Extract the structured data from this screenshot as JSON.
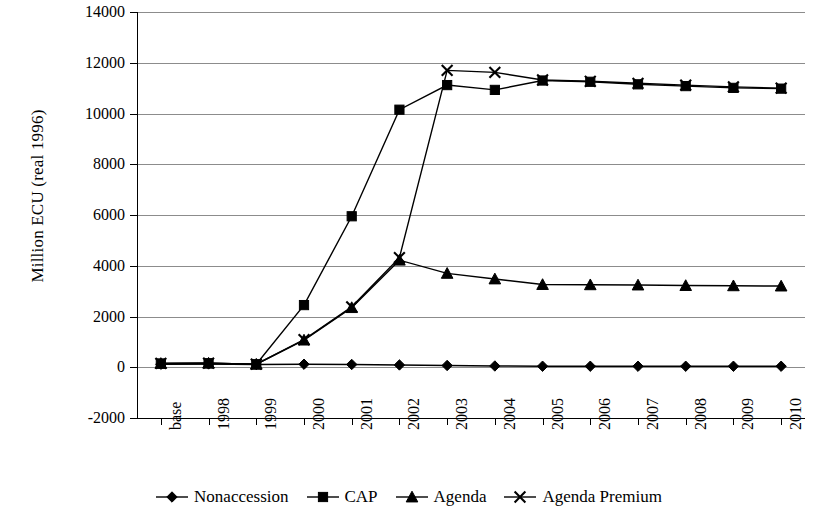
{
  "chart_data": {
    "type": "line",
    "title": "",
    "xlabel": "",
    "ylabel": "Million ECU (real 1996)",
    "categories": [
      "base",
      "1998",
      "1999",
      "2000",
      "2001",
      "2002",
      "2003",
      "2004",
      "2005",
      "2006",
      "2007",
      "2008",
      "2009",
      "2010"
    ],
    "ylim": [
      -2000,
      14000
    ],
    "ytick_step": 2000,
    "yticks": [
      "14000",
      "12000",
      "10000",
      "8000",
      "6000",
      "4000",
      "2000",
      "0",
      "-2000"
    ],
    "grid": true,
    "legend_position": "bottom",
    "series": [
      {
        "name": "Nonaccession",
        "marker": "diamond",
        "values": [
          120,
          130,
          110,
          120,
          110,
          90,
          70,
          50,
          40,
          40,
          40,
          40,
          40,
          40
        ]
      },
      {
        "name": "CAP",
        "marker": "square",
        "values": [
          150,
          160,
          120,
          2450,
          5950,
          10150,
          11120,
          10930,
          11300,
          11250,
          11150,
          11080,
          11010,
          10980
        ]
      },
      {
        "name": "Agenda",
        "marker": "triangle",
        "values": [
          150,
          160,
          120,
          1070,
          2350,
          4220,
          3700,
          3480,
          3260,
          3250,
          3240,
          3220,
          3210,
          3200
        ]
      },
      {
        "name": "Agenda Premium",
        "marker": "cross",
        "values": [
          150,
          160,
          120,
          1090,
          2380,
          4320,
          11700,
          11620,
          11320,
          11270,
          11190,
          11120,
          11050,
          11000
        ]
      }
    ]
  }
}
